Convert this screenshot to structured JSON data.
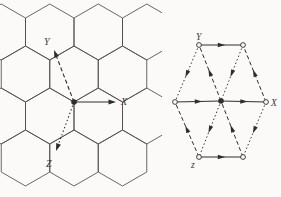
{
  "figure_meta": {
    "kind": "crystallography-diagram",
    "left_caption_semantics": "honeycomb lattice with hexagonal crystal axes",
    "right_caption_semantics": "hexagonal cell with equivalent directions marked"
  },
  "colors": {
    "background": "#fbfaf8",
    "lattice_ink": "#4d4d4d",
    "figure_ink": "#2e2e2e",
    "label_ink": "#3a3a3a"
  },
  "left_figure": {
    "hex_radius": 28,
    "hex_half_width": 24.25,
    "hex_half_side": 14,
    "hex_centers": [
      [
        1.25,
        32
      ],
      [
        49.75,
        32
      ],
      [
        98.25,
        32
      ],
      [
        146.75,
        32
      ],
      [
        25.5,
        74
      ],
      [
        74,
        74
      ],
      [
        122.5,
        74
      ],
      [
        1.25,
        116
      ],
      [
        49.75,
        116
      ],
      [
        98.25,
        116
      ],
      [
        146.75,
        116
      ],
      [
        25.5,
        158
      ],
      [
        74,
        158
      ],
      [
        122.5,
        158
      ]
    ],
    "origin": [
      74,
      102
    ],
    "axes": [
      {
        "label": "Y",
        "style": "dashed",
        "to": [
          54,
          50
        ],
        "label_pos": [
          44,
          45
        ]
      },
      {
        "label": "X",
        "style": "solid",
        "to": [
          116,
          102
        ],
        "label_pos": [
          121,
          105
        ]
      },
      {
        "label": "Z",
        "style": "dotted",
        "to": [
          56,
          151
        ],
        "label_pos": [
          46,
          167
        ]
      }
    ]
  },
  "right_figure": {
    "vertices": {
      "L": [
        175,
        102
      ],
      "TL": [
        199,
        45
      ],
      "TR": [
        243,
        45
      ],
      "R": [
        266,
        102
      ],
      "BR": [
        243,
        157
      ],
      "BL": [
        199,
        157
      ],
      "C": [
        221,
        101
      ]
    },
    "open_vertices": [
      "L",
      "TL",
      "TR",
      "R",
      "BR",
      "BL"
    ],
    "center_vertex": "C",
    "segments": [
      {
        "from": "TL",
        "to": "TR",
        "style": "solid"
      },
      {
        "from": "BL",
        "to": "BR",
        "style": "solid"
      },
      {
        "from": "L",
        "to": "C",
        "style": "solid"
      },
      {
        "from": "C",
        "to": "R",
        "style": "solid"
      },
      {
        "from": "BR",
        "to": "C",
        "style": "dashed"
      },
      {
        "from": "C",
        "to": "TL",
        "style": "dashed"
      },
      {
        "from": "BL",
        "to": "L",
        "style": "dashed"
      },
      {
        "from": "R",
        "to": "TR",
        "style": "dashed"
      },
      {
        "from": "TR",
        "to": "C",
        "style": "dotted"
      },
      {
        "from": "C",
        "to": "BL",
        "style": "dotted"
      },
      {
        "from": "TL",
        "to": "L",
        "style": "dotted"
      },
      {
        "from": "R",
        "to": "BR",
        "style": "dotted"
      }
    ],
    "labels": [
      {
        "text": "Y",
        "pos": [
          196,
          40
        ]
      },
      {
        "text": "X",
        "pos": [
          271,
          106
        ]
      },
      {
        "text": "z",
        "pos": [
          191,
          168
        ]
      }
    ]
  }
}
